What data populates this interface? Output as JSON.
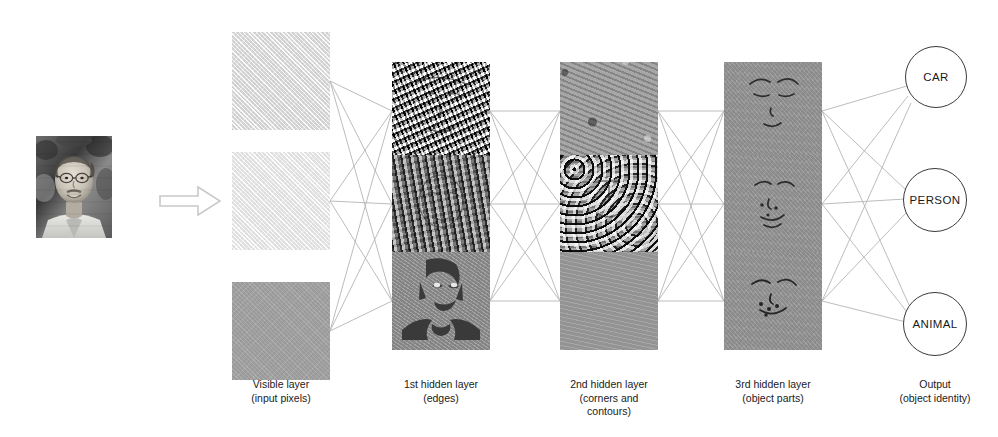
{
  "figure": {
    "flow_arrow": "arrow-right"
  },
  "input": {
    "name": "input-photograph",
    "description": "Grayscale portrait photograph of a man with glasses"
  },
  "layers": [
    {
      "id": "visible",
      "caption_line1": "Visible layer",
      "caption_line2": "(input pixels)",
      "units": [
        "visible-unit-1",
        "visible-unit-2",
        "visible-unit-3"
      ]
    },
    {
      "id": "hidden1",
      "caption_line1": "1st hidden layer",
      "caption_line2": "(edges)",
      "units": [
        "hidden1-unit-1",
        "hidden1-unit-2",
        "hidden1-unit-3"
      ]
    },
    {
      "id": "hidden2",
      "caption_line1": "2nd hidden layer",
      "caption_line2": "(corners and",
      "caption_line3": "contours)",
      "units": [
        "hidden2-unit-1",
        "hidden2-unit-2",
        "hidden2-unit-3"
      ]
    },
    {
      "id": "hidden3",
      "caption_line1": "3rd hidden layer",
      "caption_line2": "(object parts)",
      "units": [
        "hidden3-unit-1",
        "hidden3-unit-2",
        "hidden3-unit-3"
      ]
    },
    {
      "id": "output",
      "caption_line1": "Output",
      "caption_line2": "(object identity)",
      "units": [
        "CAR",
        "PERSON",
        "ANIMAL"
      ]
    }
  ],
  "output_nodes": [
    {
      "label": "CAR"
    },
    {
      "label": "PERSON"
    },
    {
      "label": "ANIMAL"
    }
  ],
  "colors": {
    "background": "#ffffff",
    "edge_line": "#b0b0b0",
    "circle_stroke": "#3a3a3a",
    "text": "#1a1a1a",
    "arrow_stroke": "#c9c9c9"
  },
  "geometry": {
    "box_size": 98,
    "column_x": [
      232,
      392,
      560,
      724
    ],
    "row_y_visible": [
      32,
      152,
      282
    ],
    "row_y_hidden": [
      62,
      155,
      252
    ],
    "circle_centers": [
      [
        935,
        76
      ],
      [
        935,
        198
      ],
      [
        935,
        322
      ]
    ],
    "circle_radius": 30
  }
}
